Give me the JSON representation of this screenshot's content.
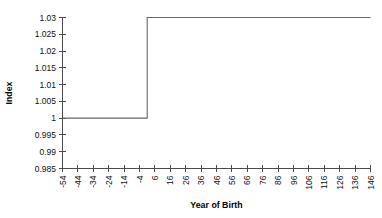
{
  "chart_data": {
    "type": "line",
    "title": "",
    "xlabel": "Year of Birth",
    "ylabel": "Index",
    "xlim": [
      -54,
      146
    ],
    "ylim": [
      0.985,
      1.03
    ],
    "grid": false,
    "legend": false,
    "step": true,
    "x_tick_labels": [
      "-54",
      "-44",
      "-34",
      "-24",
      "-14",
      "-4",
      "6",
      "16",
      "26",
      "36",
      "46",
      "56",
      "66",
      "76",
      "86",
      "96",
      "106",
      "116",
      "126",
      "136",
      "146"
    ],
    "y_tick_labels": [
      "1.03",
      "1.025",
      "1.02",
      "1.015",
      "1.01",
      "1.005",
      "1",
      "0.995",
      "0.99",
      "0.985"
    ],
    "x_ticks": [
      -54,
      -44,
      -34,
      -24,
      -14,
      -4,
      6,
      16,
      26,
      36,
      46,
      56,
      66,
      76,
      86,
      96,
      106,
      116,
      126,
      136,
      146
    ],
    "y_ticks": [
      1.03,
      1.025,
      1.02,
      1.015,
      1.01,
      1.005,
      1,
      0.995,
      0.99,
      0.985
    ],
    "series": [
      {
        "name": "Index",
        "x": [
          -54,
          1,
          1,
          146
        ],
        "values": [
          1,
          1,
          1.03,
          1.03
        ]
      }
    ],
    "step_x": 1,
    "pre_step_value": 1,
    "post_step_value": 1.03,
    "line_color": "#666666",
    "axis_color": "#4a4a4a",
    "background_color": "#ffffff"
  }
}
